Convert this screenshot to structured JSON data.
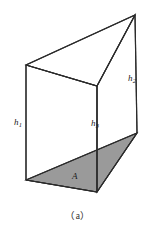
{
  "figure": {
    "caption": "（a）",
    "type": "oblique-triangular-prism",
    "colors": {
      "stroke": "#2b2b2b",
      "base_fill": "#9a9a9a",
      "background": "#ffffff",
      "label_text": "#1a1a1a"
    },
    "labels": {
      "h1": {
        "symbol": "h",
        "subscript": "1"
      },
      "h2": {
        "symbol": "h",
        "subscript": "2"
      },
      "h3": {
        "symbol": "h",
        "subscript": "3"
      },
      "area": "A"
    },
    "geometry": {
      "top_face": {
        "left": [
          26,
          65
        ],
        "front": [
          97,
          86
        ],
        "apex": [
          135,
          15
        ]
      },
      "bottom_face": {
        "left": [
          26,
          180
        ],
        "front": [
          97,
          192
        ],
        "right": [
          137,
          133
        ]
      },
      "vertical_edges": [
        {
          "name": "h1",
          "from": [
            26,
            65
          ],
          "to": [
            26,
            180
          ]
        },
        {
          "name": "h3",
          "from": [
            97,
            86
          ],
          "to": [
            97,
            192
          ]
        },
        {
          "name": "h2",
          "from": [
            135,
            15
          ],
          "to": [
            137,
            133
          ]
        }
      ]
    }
  }
}
